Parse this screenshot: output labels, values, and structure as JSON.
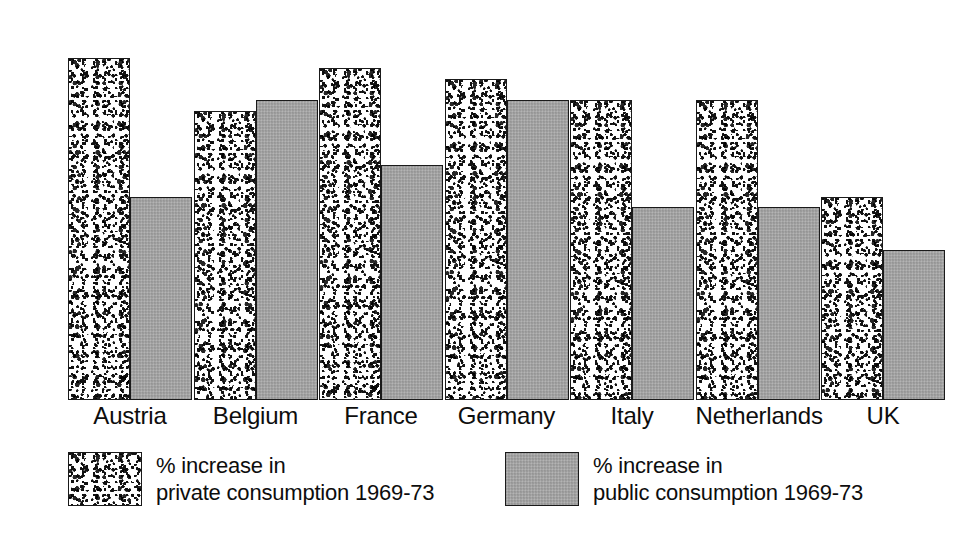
{
  "chart_data": {
    "type": "bar",
    "title": "",
    "subtitle": "",
    "xlabel": "",
    "ylabel": "",
    "ylim": [
      0,
      32
    ],
    "grid": false,
    "legend_position": "bottom",
    "categories": [
      "Austria",
      "Belgium",
      "France",
      "Germany",
      "Italy",
      "Netherlands",
      "UK"
    ],
    "series": [
      {
        "name": "% increase in private consumption 1969-73",
        "key": "private",
        "values": [
          32,
          27,
          31,
          30,
          28,
          28,
          19
        ]
      },
      {
        "name": "% increase in public consumption 1969-73",
        "key": "public",
        "values": [
          19,
          28,
          22,
          28,
          18,
          18,
          14
        ]
      }
    ],
    "value_labels": [
      [
        "32",
        "19"
      ],
      [
        "27",
        "28"
      ],
      [
        "31",
        "22"
      ],
      [
        "30",
        "28"
      ],
      [
        "28",
        "18"
      ],
      [
        "28",
        "18"
      ],
      [
        "19",
        "14"
      ]
    ]
  },
  "legend": {
    "items": [
      {
        "swatch": "speckle-swatch",
        "line1": "% increase in",
        "line2": "private consumption 1969-73"
      },
      {
        "swatch": "grey-swatch",
        "line1": "% increase in",
        "line2": "public consumption 1969-73"
      }
    ]
  },
  "colors": {
    "private_fill": "#ffffff",
    "private_speckle": "#111111",
    "public_fill": "#9a9a9a",
    "outline": "#1a1a1a",
    "text": "#0d0d0d",
    "background": "#ffffff"
  }
}
